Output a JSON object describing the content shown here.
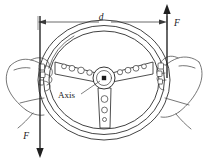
{
  "figure": {
    "background_color": "#ffffff",
    "line_color": "#2b2b2b",
    "labels": {
      "diameter": "d",
      "force_right": "F",
      "force_left": "F",
      "axis": "Axis"
    },
    "annotations": {
      "dimension_name": "diameter-dimension",
      "force_up_name": "force-arrow-up",
      "force_down_name": "force-arrow-down",
      "axis_callout_name": "axis-callout"
    },
    "geometry": {
      "wheel_center_x": 104,
      "wheel_center_y": 80,
      "rim_outer_rx": 66,
      "rim_outer_ry": 60,
      "rim_inner_rx": 58,
      "rim_inner_ry": 52,
      "hub_radius": 11,
      "spoke_count": 3,
      "dimension_y": 22,
      "dimension_x_left": 38,
      "dimension_x_right": 167,
      "force_up_x": 167,
      "force_up_top_y": 5,
      "force_up_bottom_y": 78,
      "force_down_x": 40,
      "force_down_top_y": 16,
      "force_down_bottom_y": 158
    },
    "spoke_holes": {
      "left_spoke": [
        2.6,
        3.0,
        3.4,
        2.4
      ],
      "right_spoke": [
        2.4,
        3.0,
        3.0,
        2.6
      ],
      "bottom_spoke": [
        3.4,
        3.0,
        2.0
      ]
    }
  }
}
